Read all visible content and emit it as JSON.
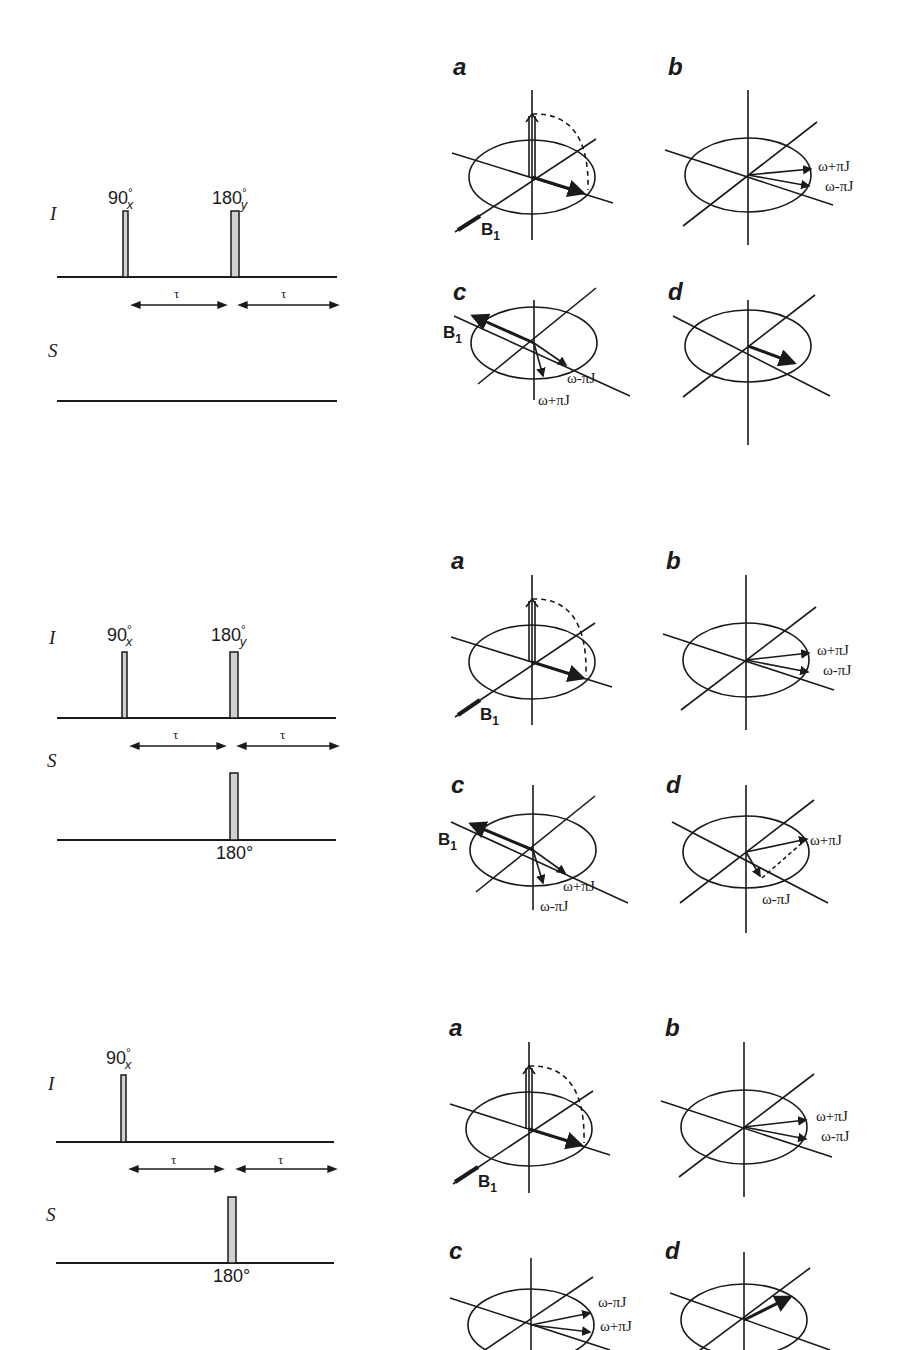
{
  "figure": {
    "panels": [
      {
        "id": "panel-1",
        "sequence": {
          "channels": [
            {
              "label": "I",
              "pulses": [
                {
                  "angle": "90",
                  "phase": "x"
                },
                {
                  "angle": "180",
                  "phase": "y"
                }
              ]
            },
            {
              "label": "S",
              "pulses": []
            }
          ],
          "delays": [
            "τ",
            "τ"
          ]
        },
        "vectors": {
          "a": {
            "label": "a",
            "field": "B",
            "field_sub": "1"
          },
          "b": {
            "label": "b",
            "freq_upper": "ω+πJ",
            "freq_lower": "ω-πJ"
          },
          "c": {
            "label": "c",
            "field": "B",
            "field_sub": "1",
            "freq_a": "ω-πJ",
            "freq_b": "ω+πJ"
          },
          "d": {
            "label": "d"
          }
        }
      },
      {
        "id": "panel-2",
        "sequence": {
          "channels": [
            {
              "label": "I",
              "pulses": [
                {
                  "angle": "90",
                  "phase": "x"
                },
                {
                  "angle": "180",
                  "phase": "y"
                }
              ]
            },
            {
              "label": "S",
              "pulses": [
                {
                  "angle": "180°"
                }
              ]
            }
          ],
          "delays": [
            "τ",
            "τ"
          ]
        },
        "vectors": {
          "a": {
            "label": "a",
            "field": "B",
            "field_sub": "1"
          },
          "b": {
            "label": "b",
            "freq_upper": "ω+πJ",
            "freq_lower": "ω-πJ"
          },
          "c": {
            "label": "c",
            "field": "B",
            "field_sub": "1",
            "freq_a": "ω+πJ",
            "freq_b": "ω-πJ"
          },
          "d": {
            "label": "d",
            "freq_a": "ω+πJ",
            "freq_b": "ω-πJ"
          }
        }
      },
      {
        "id": "panel-3",
        "sequence": {
          "channels": [
            {
              "label": "I",
              "pulses": [
                {
                  "angle": "90",
                  "phase": "x"
                }
              ]
            },
            {
              "label": "S",
              "pulses": [
                {
                  "angle": "180°"
                }
              ]
            }
          ],
          "delays": [
            "τ",
            "τ"
          ]
        },
        "vectors": {
          "a": {
            "label": "a",
            "field": "B",
            "field_sub": "1"
          },
          "b": {
            "label": "b",
            "freq_upper": "ω+πJ",
            "freq_lower": "ω-πJ"
          },
          "c": {
            "label": "c",
            "freq_a": "ω-πJ",
            "freq_b": "ω+πJ"
          },
          "d": {
            "label": "d"
          }
        }
      }
    ],
    "degree_symbol": "°",
    "colors": {
      "ink": "#1a1a1a",
      "pulse_fill": "#d0d0d0"
    }
  }
}
